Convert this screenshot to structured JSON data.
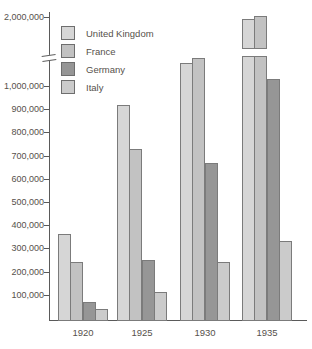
{
  "chart_data": {
    "type": "bar",
    "title": "",
    "xlabel": "",
    "ylabel": "",
    "grid": false,
    "categories": [
      "1920",
      "1925",
      "1930",
      "1935"
    ],
    "series": [
      {
        "name": "United Kingdom",
        "color": "#d6d6d6",
        "values": [
          360000,
          920000,
          1100000,
          1950000
        ]
      },
      {
        "name": "France",
        "color": "#c2c2c2",
        "values": [
          240000,
          730000,
          1120000,
          2020000
        ]
      },
      {
        "name": "Germany",
        "color": "#969696",
        "values": [
          70000,
          250000,
          670000,
          1030000
        ]
      },
      {
        "name": "Italy",
        "color": "#cbcbcb",
        "values": [
          40000,
          110000,
          240000,
          330000
        ]
      }
    ],
    "y_axis": {
      "tick_labels": [
        "2,000,000",
        "1,000,000",
        "900,000",
        "800,000",
        "700,000",
        "600,000",
        "500,000",
        "400,000",
        "300,000",
        "200,000",
        "100,000"
      ],
      "tick_values": [
        2000000,
        1000000,
        900000,
        800000,
        700000,
        600000,
        500000,
        400000,
        300000,
        200000,
        100000
      ],
      "range_low": [
        0,
        1000000
      ],
      "range_high_tick": 2000000,
      "broken_axis": true,
      "break_below_value": 1125000
    },
    "legend": {
      "position": "top-left-inside"
    }
  },
  "colors": {
    "background": "#ffffff",
    "axis": "#5a5a5a",
    "text": "#56514b",
    "bar_border": "#7b7b7b"
  }
}
